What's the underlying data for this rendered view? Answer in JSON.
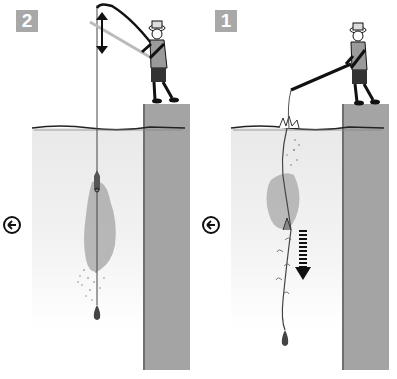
{
  "panels": [
    {
      "id": "step-2",
      "step_label": "2",
      "description_elements": [
        "angler-raising-rod",
        "vertical-line",
        "up-down-arrow",
        "sinking-groundbait-cloud",
        "weight"
      ],
      "direction_icon": "left-arrow-circle-icon"
    },
    {
      "id": "step-1",
      "step_label": "1",
      "description_elements": [
        "angler-holding-rod-low",
        "splash",
        "sinking-line-with-baits",
        "groundbait-cloud",
        "down-arrow-dashed",
        "weight"
      ],
      "direction_icon": "left-arrow-circle-icon"
    }
  ],
  "colors": {
    "badge": "#a8a8a8",
    "pier": "#a4a4a4",
    "pier_edge": "#6f6f6f",
    "water_top": "#e9e9e9",
    "cloud": "#9c9c9c",
    "ink": "#111111"
  }
}
